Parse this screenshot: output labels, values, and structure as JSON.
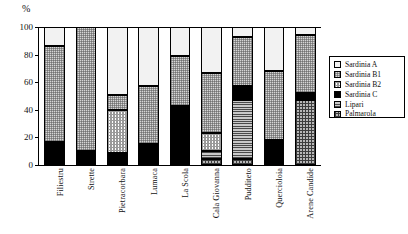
{
  "chart_data": {
    "type": "bar",
    "title": "",
    "subtype": "stacked-bar-100-percent",
    "xlabel": "",
    "ylabel": "%",
    "ylim": [
      0,
      100
    ],
    "yticks": [
      0,
      20,
      40,
      60,
      80,
      100
    ],
    "ytick_labels": [
      "0",
      "20",
      "40",
      "60",
      "80",
      "100"
    ],
    "grid": false,
    "legend_position": "right",
    "categories": [
      "Filiestru",
      "Strette",
      "Pietracorbara",
      "Lumaca",
      "La Scola",
      "Cala Giovanna",
      "Pudditeto",
      "Quercioloia",
      "Arene Candide"
    ],
    "series": [
      {
        "name": "Sardinia A",
        "pattern": "solid-white",
        "color": "#f2f2f2",
        "values": [
          14,
          0,
          49,
          43,
          21,
          33,
          7,
          32,
          6
        ]
      },
      {
        "name": "Sardinia B1",
        "pattern": "fine-dotted-gray",
        "color": "#d6d6d6",
        "values": [
          69,
          90,
          11,
          42,
          36,
          44,
          36,
          50,
          42
        ]
      },
      {
        "name": "Sardinia B2",
        "pattern": "checkered-light",
        "color": "#ffffff",
        "values": [
          2,
          0,
          31,
          0,
          0,
          13,
          0,
          0,
          0
        ]
      },
      {
        "name": "Sardinia C",
        "pattern": "solid-black",
        "color": "#000000",
        "values": [
          15,
          10,
          9,
          15,
          43,
          0,
          10,
          18,
          5
        ]
      },
      {
        "name": "Lipari",
        "pattern": "horizontal-lines",
        "color": "#c9c9c9",
        "values": [
          0,
          0,
          0,
          0,
          0,
          6,
          43,
          0,
          0
        ]
      },
      {
        "name": "Palmarola",
        "pattern": "crosshatch-grid",
        "color": "#b8b8b8",
        "values": [
          0,
          0,
          0,
          0,
          0,
          4,
          4,
          0,
          47
        ]
      }
    ],
    "stack_order_bottom_to_top": [
      "Palmarola",
      "Lipari",
      "Sardinia C",
      "Sardinia B2",
      "Sardinia B1",
      "Sardinia A"
    ]
  },
  "legend": {
    "items": [
      {
        "label": "Sardinia A",
        "swatch": "swatch-sardinia-a"
      },
      {
        "label": "Sardinia B1",
        "swatch": "swatch-sardinia-b1"
      },
      {
        "label": "Sardinia B2",
        "swatch": "swatch-sardinia-b2"
      },
      {
        "label": "Sardinia C",
        "swatch": "swatch-sardinia-c"
      },
      {
        "label": "Lipari",
        "swatch": "swatch-lipari"
      },
      {
        "label": "Palmarola",
        "swatch": "swatch-palmarola"
      }
    ]
  }
}
